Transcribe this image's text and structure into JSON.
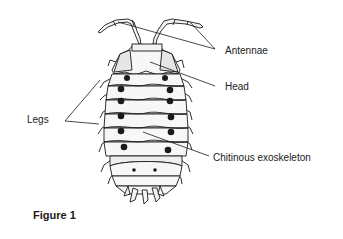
{
  "figure": {
    "caption": "Figure 1",
    "labels": {
      "antennae": "Antennae",
      "head": "Head",
      "legs": "Legs",
      "exoskeleton": "Chitinous exoskeleton"
    }
  },
  "colors": {
    "ink": "#1a1a1a",
    "shade": "#e6e6e6",
    "background": "#ffffff"
  }
}
